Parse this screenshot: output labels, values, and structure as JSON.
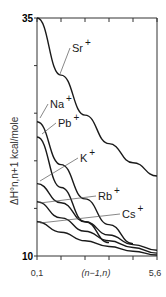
{
  "chart_data": {
    "type": "line",
    "title": "",
    "xlabel": "(n−1,n)",
    "ylabel": "ΔH°n,n+1 kcal/mole",
    "x": [
      "0,1",
      "1,2",
      "2,3",
      "3,4",
      "4,5",
      "5,6"
    ],
    "x_tick_labels": {
      "left": "0,1",
      "middle": "(n−1,n)",
      "right": "5,6"
    },
    "y_tick_labels": {
      "top": "35",
      "bottom": "10"
    },
    "ylim": [
      10,
      35
    ],
    "grid": false,
    "legend": "inline labels with leader lines",
    "series": [
      {
        "name": "Sr+",
        "values": [
          35.0,
          29.0,
          24.8,
          21.8,
          19.8,
          18.4
        ]
      },
      {
        "name": "Na+",
        "values": [
          24.1,
          19.6,
          16.0,
          13.3,
          11.3,
          null
        ]
      },
      {
        "name": "Pb+",
        "values": [
          22.5,
          17.2,
          13.6,
          11.4,
          null,
          null
        ]
      },
      {
        "name": "K+",
        "values": [
          17.6,
          15.6,
          13.6,
          12.2,
          11.2,
          10.6
        ]
      },
      {
        "name": "Rb+",
        "values": [
          15.7,
          14.0,
          12.6,
          11.6,
          10.9,
          10.3
        ]
      },
      {
        "name": "Cs+",
        "values": [
          13.6,
          12.5,
          11.6,
          11.0,
          10.5,
          10.1
        ]
      }
    ]
  }
}
